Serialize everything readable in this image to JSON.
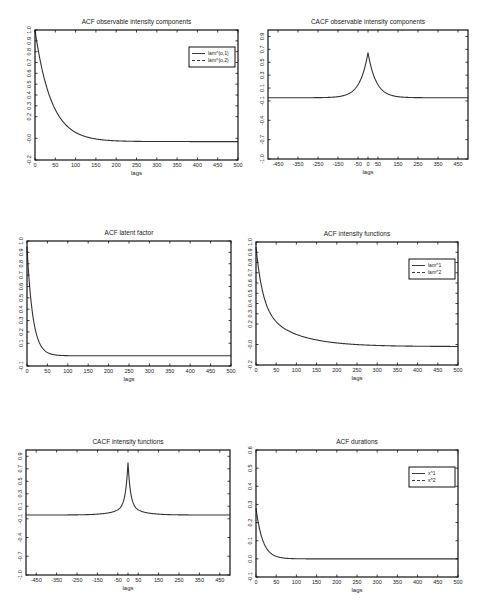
{
  "chart_data": [
    {
      "id": "c1",
      "type": "line",
      "title": "ACF observable intensity components",
      "xlabel": "lags",
      "ylabel": "",
      "box": {
        "left": 35,
        "top": 30,
        "right": 238,
        "bottom": 160
      },
      "xlim": [
        0,
        500
      ],
      "ylim": [
        -0.2,
        1.0
      ],
      "xticks": [
        0,
        50,
        100,
        150,
        200,
        250,
        300,
        350,
        400,
        450,
        500
      ],
      "xtick_labels": [
        "0",
        "50",
        "100",
        "150",
        "200",
        "250",
        "300",
        "350",
        "400",
        "450",
        "500"
      ],
      "yticks": [
        -0.2,
        0.0,
        0.2,
        0.3,
        0.4,
        0.5,
        0.6,
        0.7,
        0.8,
        0.9,
        1.0
      ],
      "ytick_labels": [
        "-0.2",
        "-0.0",
        "0.2",
        "0.3",
        "0.4",
        "0.5",
        "0.6",
        "0.7",
        "0.8",
        "0.9",
        "1.0"
      ],
      "grid": false,
      "legend": {
        "position": "upper right",
        "entries": [
          "lam^{o,1}",
          "lam^{o,2}"
        ]
      },
      "curve": {
        "kind": "decay",
        "start": 1.0,
        "end": -0.03,
        "rate": 0.025
      },
      "series": [
        {
          "name": "lam^{o,1}",
          "style": "solid",
          "x": [
            0,
            25,
            50,
            75,
            100,
            150,
            200,
            300,
            400,
            500
          ],
          "values": [
            1.0,
            0.53,
            0.28,
            0.14,
            0.06,
            0.0,
            -0.02,
            -0.03,
            -0.03,
            -0.03
          ]
        },
        {
          "name": "lam^{o,2}",
          "style": "dashed",
          "x": [
            0,
            25,
            50,
            75,
            100,
            150,
            200,
            300,
            400,
            500
          ],
          "values": [
            1.0,
            0.53,
            0.28,
            0.14,
            0.06,
            0.0,
            -0.02,
            -0.03,
            -0.03,
            -0.03
          ]
        }
      ]
    },
    {
      "id": "c2",
      "type": "line",
      "title": "CACF observable intensity components",
      "xlabel": "lags",
      "ylabel": "",
      "box": {
        "left": 268,
        "top": 30,
        "right": 468,
        "bottom": 159
      },
      "xlim": [
        -500,
        500
      ],
      "ylim": [
        -1.0,
        1.0
      ],
      "xticks": [
        -450,
        -350,
        -250,
        -150,
        -50,
        0,
        50,
        150,
        250,
        350,
        450
      ],
      "xtick_labels": [
        "-450",
        "-350",
        "-250",
        "-150",
        "-50",
        "0",
        "50",
        "150",
        "250",
        "350",
        "450"
      ],
      "yticks": [
        -1.0,
        -0.7,
        -0.4,
        -0.1,
        0.1,
        0.3,
        0.5,
        0.7,
        0.9
      ],
      "ytick_labels": [
        "-1.0",
        "-0.7",
        "-0.4",
        "-0.1",
        "0.1",
        "0.3",
        "0.5",
        "0.7",
        "0.9"
      ],
      "grid": false,
      "legend": null,
      "curve": {
        "kind": "peak",
        "base": -0.05,
        "peak": 0.65,
        "width": 40
      },
      "series": [
        {
          "name": "CACF",
          "style": "solid",
          "x": [
            -500,
            -200,
            -100,
            -50,
            0,
            50,
            100,
            200,
            500
          ],
          "values": [
            -0.05,
            -0.05,
            0.01,
            0.15,
            0.65,
            0.15,
            0.01,
            -0.05,
            -0.05
          ]
        }
      ]
    },
    {
      "id": "c3",
      "type": "line",
      "title": "ACF latent factor",
      "xlabel": "lags",
      "ylabel": "",
      "box": {
        "left": 27,
        "top": 241,
        "right": 231,
        "bottom": 366
      },
      "xlim": [
        0,
        500
      ],
      "ylim": [
        -0.1,
        1.0
      ],
      "xticks": [
        0,
        50,
        100,
        150,
        200,
        250,
        300,
        350,
        400,
        450,
        500
      ],
      "xtick_labels": [
        "0",
        "50",
        "100",
        "150",
        "200",
        "250",
        "300",
        "350",
        "400",
        "450",
        "500"
      ],
      "yticks": [
        -0.1,
        0.1,
        0.2,
        0.3,
        0.4,
        0.5,
        0.6,
        0.7,
        0.8,
        0.9,
        1.0
      ],
      "ytick_labels": [
        "-0.1",
        "0.1",
        "0.2",
        "0.3",
        "0.4",
        "0.5",
        "0.6",
        "0.7",
        "0.8",
        "0.9",
        "1.0"
      ],
      "grid": false,
      "legend": null,
      "curve": {
        "kind": "decay",
        "start": 0.95,
        "end": -0.01,
        "rate": 0.07
      },
      "series": [
        {
          "name": "ACF latent factor",
          "style": "solid",
          "x": [
            0,
            5,
            10,
            20,
            30,
            50,
            75,
            100,
            200,
            300,
            500
          ],
          "values": [
            0.95,
            0.6,
            0.42,
            0.2,
            0.1,
            0.03,
            0.01,
            0.0,
            -0.005,
            -0.01,
            -0.01
          ]
        }
      ]
    },
    {
      "id": "c4",
      "type": "line",
      "title": "ACF intensity functions",
      "xlabel": "lags",
      "ylabel": "",
      "box": {
        "left": 256,
        "top": 242,
        "right": 458,
        "bottom": 365
      },
      "xlim": [
        0,
        500
      ],
      "ylim": [
        -0.2,
        1.0
      ],
      "xticks": [
        0,
        50,
        100,
        150,
        200,
        250,
        300,
        350,
        400,
        450,
        500
      ],
      "xtick_labels": [
        "0",
        "50",
        "100",
        "150",
        "200",
        "250",
        "300",
        "350",
        "400",
        "450",
        "500"
      ],
      "yticks": [
        -0.2,
        0.0,
        0.2,
        0.3,
        0.4,
        0.5,
        0.6,
        0.7,
        0.8,
        0.9,
        1.0
      ],
      "ytick_labels": [
        "-0.2",
        "-0.0",
        "0.2",
        "0.3",
        "0.4",
        "0.5",
        "0.6",
        "0.7",
        "0.8",
        "0.9",
        "1.0"
      ],
      "grid": false,
      "legend": {
        "position": "upper right",
        "entries": [
          "lam^1",
          "lam^2"
        ]
      },
      "curve": {
        "kind": "decay2",
        "start": 0.95,
        "end": -0.02,
        "rate": 0.06,
        "rate2": 0.012,
        "w": 0.6
      },
      "series": [
        {
          "name": "lam^1",
          "style": "solid",
          "x": [
            0,
            10,
            25,
            50,
            100,
            150,
            200,
            300,
            500
          ],
          "values": [
            0.95,
            0.5,
            0.28,
            0.14,
            0.05,
            0.01,
            -0.01,
            -0.02,
            -0.02
          ]
        },
        {
          "name": "lam^2",
          "style": "dashed",
          "x": [
            0,
            10,
            25,
            50,
            100,
            150,
            200,
            300,
            500
          ],
          "values": [
            0.95,
            0.5,
            0.28,
            0.14,
            0.05,
            0.01,
            -0.01,
            -0.02,
            -0.02
          ]
        }
      ]
    },
    {
      "id": "c5",
      "type": "line",
      "title": "CACF intensity functions",
      "xlabel": "lags",
      "ylabel": "",
      "box": {
        "left": 26,
        "top": 450,
        "right": 230,
        "bottom": 575
      },
      "xlim": [
        -500,
        500
      ],
      "ylim": [
        -1.0,
        1.0
      ],
      "xticks": [
        -450,
        -350,
        -250,
        -150,
        -50,
        0,
        50,
        150,
        250,
        350,
        450
      ],
      "xtick_labels": [
        "-450",
        "-350",
        "-250",
        "-150",
        "-50",
        "0",
        "50",
        "150",
        "250",
        "350",
        "450"
      ],
      "yticks": [
        -1.0,
        -0.7,
        -0.4,
        -0.1,
        0.1,
        0.3,
        0.5,
        0.7,
        0.9
      ],
      "ytick_labels": [
        "-1.0",
        "-0.7",
        "-0.4",
        "-0.1",
        "0.1",
        "0.3",
        "0.5",
        "0.7",
        "0.9"
      ],
      "grid": false,
      "legend": null,
      "curve": {
        "kind": "sharp",
        "base": -0.04,
        "peak": 0.8,
        "width": 12
      },
      "series": [
        {
          "name": "CACF",
          "style": "solid",
          "x": [
            -500,
            -150,
            -50,
            -20,
            0,
            20,
            50,
            150,
            500
          ],
          "values": [
            -0.04,
            -0.03,
            0.02,
            0.15,
            0.8,
            0.15,
            0.02,
            -0.03,
            -0.04
          ]
        }
      ]
    },
    {
      "id": "c6",
      "type": "line",
      "title": "ACF durations",
      "xlabel": "lags",
      "ylabel": "",
      "box": {
        "left": 256,
        "top": 450,
        "right": 458,
        "bottom": 577
      },
      "xlim": [
        0,
        500
      ],
      "ylim": [
        -0.1,
        0.6
      ],
      "xticks": [
        0,
        50,
        100,
        150,
        200,
        250,
        300,
        350,
        400,
        450,
        500
      ],
      "xtick_labels": [
        "0",
        "50",
        "100",
        "150",
        "200",
        "250",
        "300",
        "350",
        "400",
        "450",
        "500"
      ],
      "yticks": [
        -0.1,
        0.0,
        0.1,
        0.2,
        0.3,
        0.4,
        0.5,
        0.6
      ],
      "ytick_labels": [
        "-0.1",
        "0.0",
        "0.1",
        "0.2",
        "0.3",
        "0.4",
        "0.5",
        "0.6"
      ],
      "grid": false,
      "legend": {
        "position": "upper right",
        "entries": [
          "x^1",
          "x^2"
        ]
      },
      "curve": {
        "kind": "decay",
        "start": 0.28,
        "end": 0.0,
        "rate": 0.06
      },
      "series": [
        {
          "name": "x^1",
          "style": "solid",
          "x": [
            0,
            10,
            25,
            50,
            100,
            200,
            500
          ],
          "values": [
            0.28,
            0.15,
            0.07,
            0.02,
            0.005,
            0.0,
            -0.005
          ]
        },
        {
          "name": "x^2",
          "style": "dashed",
          "x": [
            0,
            10,
            25,
            50,
            100,
            200,
            500
          ],
          "values": [
            0.28,
            0.15,
            0.07,
            0.02,
            0.005,
            0.0,
            -0.005
          ]
        }
      ]
    }
  ]
}
